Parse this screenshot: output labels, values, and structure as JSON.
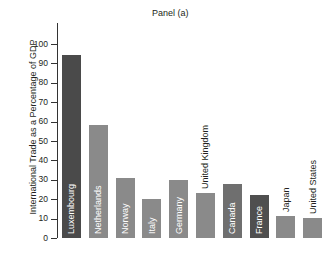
{
  "chart_data": {
    "type": "bar",
    "title": "Panel (a)",
    "xlabel": "",
    "ylabel": "International Trade as a Percentage of GDP",
    "ylim": [
      0,
      100
    ],
    "yticks": [
      0,
      10,
      20,
      30,
      40,
      50,
      60,
      70,
      80,
      90,
      100
    ],
    "grid": false,
    "legend": "none",
    "categories": [
      "Luxembourg",
      "Netherlands",
      "Norway",
      "Italy",
      "Germany",
      "United Kingdom",
      "Canada",
      "France",
      "Japan",
      "United States"
    ],
    "values": [
      94.5,
      58.5,
      31,
      20,
      30,
      23,
      28,
      22,
      11.5,
      10.5
    ],
    "bar_colors": [
      "#4a4a4a",
      "#8a8a8a",
      "#8a8a8a",
      "#8a8a8a",
      "#8a8a8a",
      "#8a8a8a",
      "#6f6f6f",
      "#4f4f4f",
      "#8a8a8a",
      "#8a8a8a"
    ],
    "label_placement": [
      "inside",
      "inside",
      "inside",
      "inside",
      "inside",
      "outside",
      "inside",
      "inside",
      "outside",
      "outside"
    ]
  },
  "axis": {
    "tick_labels": [
      "100",
      "90",
      "80",
      "70",
      "60",
      "50",
      "40",
      "30",
      "20",
      "10",
      "0"
    ]
  }
}
